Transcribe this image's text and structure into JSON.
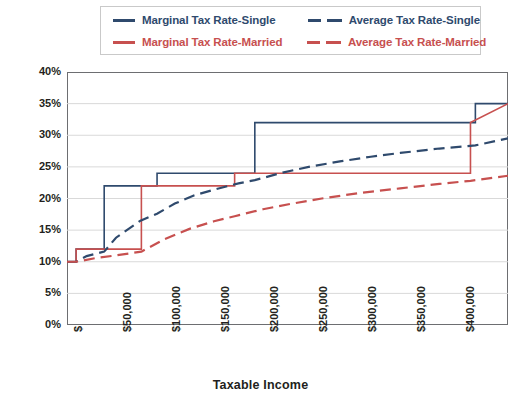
{
  "chart_data": {
    "type": "line",
    "title": "",
    "xlabel": "Taxable Income",
    "ylabel": "Tax Rate",
    "xlim": [
      0,
      450000
    ],
    "ylim": [
      0,
      0.4
    ],
    "grid": true,
    "legend_position": "top",
    "y_ticks": [
      "0%",
      "5%",
      "10%",
      "15%",
      "20%",
      "25%",
      "30%",
      "35%",
      "40%"
    ],
    "y_tick_values": [
      0,
      5,
      10,
      15,
      20,
      25,
      30,
      35,
      40
    ],
    "x_ticks": [
      "$",
      "$50,000",
      "$100,000",
      "$150,000",
      "$200,000",
      "$250,000",
      "$300,000",
      "$350,000",
      "$400,000"
    ],
    "x_tick_values": [
      0,
      50000,
      100000,
      150000,
      200000,
      250000,
      300000,
      350000,
      400000
    ],
    "series": [
      {
        "name": "Marginal Tax Rate-Single",
        "style": "solid",
        "color": "#2f4a6d",
        "type": "step",
        "x": [
          0,
          9325,
          9325,
          37950,
          37950,
          91900,
          91900,
          191650,
          191650,
          416700,
          416700,
          450000
        ],
        "values": [
          10,
          10,
          12,
          12,
          22,
          22,
          24,
          24,
          32,
          32,
          35,
          35
        ]
      },
      {
        "name": "Marginal Tax Rate-Married",
        "style": "solid",
        "color": "#c7504f",
        "type": "step",
        "x": [
          0,
          9325,
          9325,
          75900,
          75900,
          171050,
          171050,
          411700,
          411700,
          450000
        ],
        "values": [
          10,
          10,
          12,
          12,
          22,
          22,
          24,
          24,
          32,
          35
        ]
      },
      {
        "name": "Average Tax Rate-Single",
        "style": "dashed",
        "color": "#2f4a6d",
        "type": "line",
        "x": [
          0,
          9325,
          20000,
          37950,
          50000,
          75000,
          91900,
          110000,
          130000,
          150000,
          175000,
          191650,
          220000,
          250000,
          280000,
          310000,
          340000,
          380000,
          416700,
          450000
        ],
        "values": [
          10.0,
          10.0,
          10.9,
          11.6,
          13.8,
          16.5,
          17.6,
          19.2,
          20.5,
          21.4,
          22.4,
          22.9,
          24.1,
          25.1,
          25.9,
          26.6,
          27.2,
          27.9,
          28.4,
          29.5
        ]
      },
      {
        "name": "Average Tax Rate-Married",
        "style": "dashed",
        "color": "#c7504f",
        "type": "line",
        "x": [
          0,
          9325,
          30000,
          50000,
          75900,
          100000,
          125000,
          150000,
          171050,
          200000,
          230000,
          260000,
          300000,
          340000,
          380000,
          411700,
          450000
        ],
        "values": [
          10.0,
          10.0,
          10.6,
          11.0,
          11.6,
          13.6,
          15.2,
          16.4,
          17.2,
          18.3,
          19.2,
          20.0,
          20.9,
          21.6,
          22.3,
          22.8,
          23.6
        ]
      }
    ]
  },
  "legend": {
    "entries": [
      {
        "label": "Marginal Tax Rate-Single",
        "color": "#2f4a6d",
        "style": "solid"
      },
      {
        "label": "Average Tax Rate-Single",
        "color": "#2f4a6d",
        "style": "dashed"
      },
      {
        "label": "Marginal Tax Rate-Married",
        "color": "#c7504f",
        "style": "solid"
      },
      {
        "label": "Average Tax Rate-Married",
        "color": "#c7504f",
        "style": "dashed"
      }
    ]
  },
  "axes": {
    "y_title": "Tax Rate",
    "x_title": "Taxable Income"
  },
  "colors": {
    "navy": "#2f4a6d",
    "red": "#c7504f",
    "grid": "#d9d9d9",
    "frame": "#6d6e71"
  }
}
